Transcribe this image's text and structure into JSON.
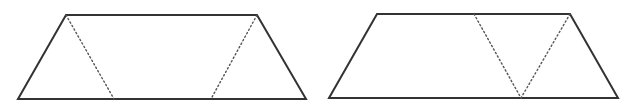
{
  "diagram": {
    "width": 633,
    "height": 107,
    "background": "#ffffff",
    "stroke_color": "#333333",
    "dotted_color": "#555555",
    "figures": [
      {
        "name": "left-trapezoid",
        "outline": [
          [
            66,
            15
          ],
          [
            257,
            15
          ],
          [
            306,
            99
          ],
          [
            18,
            99
          ]
        ],
        "dotted_lines": [
          {
            "from": [
              66,
              15
            ],
            "to": [
              114,
              99
            ]
          },
          {
            "from": [
              257,
              15
            ],
            "to": [
              211,
              99
            ]
          }
        ]
      },
      {
        "name": "right-trapezoid",
        "outline": [
          [
            377,
            14
          ],
          [
            570,
            14
          ],
          [
            618,
            98
          ],
          [
            329,
            98
          ]
        ],
        "dotted_lines": [
          {
            "from": [
              474,
              14
            ],
            "to": [
              521,
              98
            ]
          },
          {
            "from": [
              570,
              14
            ],
            "to": [
              521,
              98
            ]
          }
        ]
      }
    ]
  }
}
